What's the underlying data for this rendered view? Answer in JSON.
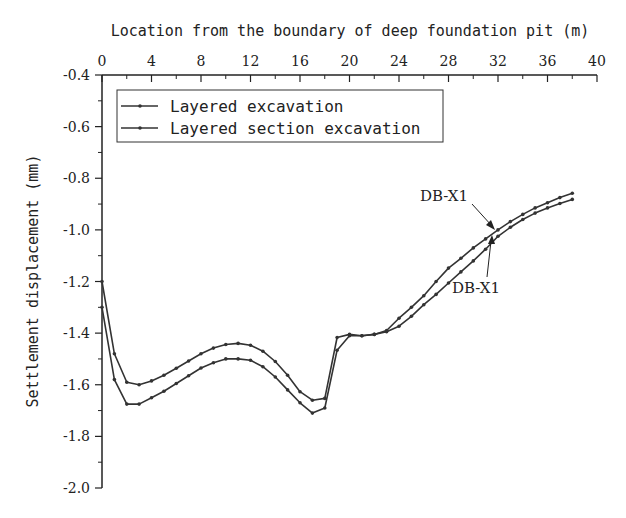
{
  "chart_data": {
    "type": "line",
    "title": "",
    "xlabel": "Location from the boundary of deep foundation pit (m)",
    "ylabel": "Settlement displacement (mm)",
    "xlim": [
      0,
      40
    ],
    "ylim": [
      -2.0,
      -0.4
    ],
    "x_ticks": [
      0,
      4,
      8,
      12,
      16,
      20,
      24,
      28,
      32,
      36,
      40
    ],
    "x_tick_labels": [
      "0",
      "4",
      "8",
      "12",
      "16",
      "20",
      "24",
      "28",
      "32",
      "36",
      "40"
    ],
    "y_ticks": [
      -0.4,
      -0.6,
      -0.8,
      -1.0,
      -1.2,
      -1.4,
      -1.6,
      -1.8,
      -2.0
    ],
    "y_tick_labels": [
      "-0.4",
      "-0.6",
      "-0.8",
      "-1.0",
      "-1.2",
      "-1.4",
      "-1.6",
      "-1.8",
      "-2.0"
    ],
    "x_axis_position": "top",
    "grid": false,
    "legend_position": "upper left",
    "x": [
      0,
      1,
      2,
      3,
      4,
      5,
      6,
      7,
      8,
      9,
      10,
      11,
      12,
      13,
      14,
      15,
      16,
      17,
      18,
      19,
      20,
      21,
      22,
      23,
      24,
      25,
      26,
      27,
      28,
      29,
      30,
      31,
      32,
      33,
      34,
      35,
      36,
      37,
      38
    ],
    "series": [
      {
        "name": "Layered excavation",
        "values": [
          -1.3,
          -1.58,
          -1.675,
          -1.675,
          -1.65,
          -1.625,
          -1.595,
          -1.565,
          -1.535,
          -1.515,
          -1.5,
          -1.5,
          -1.505,
          -1.53,
          -1.57,
          -1.62,
          -1.67,
          -1.71,
          -1.69,
          -1.466,
          -1.41,
          -1.41,
          -1.405,
          -1.395,
          -1.373,
          -1.335,
          -1.29,
          -1.25,
          -1.206,
          -1.163,
          -1.12,
          -1.075,
          -1.025,
          -0.99,
          -0.96,
          -0.935,
          -0.915,
          -0.898,
          -0.882
        ]
      },
      {
        "name": "Layered section excavation",
        "values": [
          -1.2,
          -1.48,
          -1.59,
          -1.6,
          -1.585,
          -1.563,
          -1.536,
          -1.508,
          -1.48,
          -1.458,
          -1.444,
          -1.44,
          -1.447,
          -1.47,
          -1.51,
          -1.563,
          -1.627,
          -1.66,
          -1.653,
          -1.417,
          -1.405,
          -1.41,
          -1.405,
          -1.39,
          -1.342,
          -1.3,
          -1.255,
          -1.2,
          -1.148,
          -1.11,
          -1.07,
          -1.035,
          -1.0,
          -0.968,
          -0.94,
          -0.915,
          -0.895,
          -0.875,
          -0.858
        ]
      }
    ],
    "annotations": [
      {
        "text": "DB-X1",
        "points_to_series": "Layered section excavation",
        "x": 32,
        "y": -1.0
      },
      {
        "text": "DB-X1",
        "points_to_series": "Layered excavation",
        "x": 31.5,
        "y": -1.04
      }
    ]
  }
}
